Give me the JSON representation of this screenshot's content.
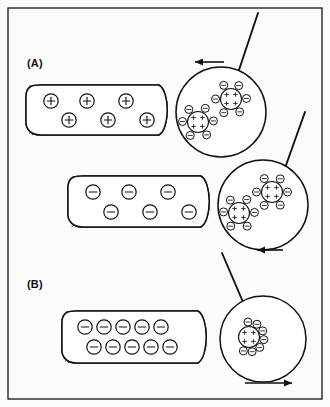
{
  "figure": {
    "background_color": "#fbfbfa",
    "ink_color": "#111111",
    "width": 330,
    "height": 407,
    "frame": {
      "x": 8,
      "y": 8,
      "width": 314,
      "height": 391
    }
  },
  "panels": [
    {
      "id": "panel-a",
      "label": "(A)",
      "label_x": 27,
      "label_y": 67
    },
    {
      "id": "panel-b",
      "label": "(B)",
      "label_x": 27,
      "label_y": 288
    }
  ],
  "capsules": [
    {
      "id": "capsule-a-positive",
      "panel": "(A)",
      "charge_sign": "+",
      "charge_symbol": "⊕",
      "x": 29,
      "y": 85,
      "width": 137,
      "height": 50,
      "corner_radius": 12,
      "hatch_band_width": 9,
      "carrier_radius": 7.2,
      "carrier_count": 6,
      "rows": [
        {
          "y_offset": 16,
          "x_offsets": [
            22,
            58,
            97
          ]
        },
        {
          "y_offset": 35,
          "x_offsets": [
            40,
            79,
            118
          ]
        }
      ]
    },
    {
      "id": "capsule-a-negative",
      "panel": "(A)",
      "charge_sign": "-",
      "charge_symbol": "⊖",
      "x": 71,
      "y": 176,
      "width": 137,
      "height": 51,
      "corner_radius": 12,
      "hatch_band_width": 9,
      "carrier_radius": 7.2,
      "carrier_count": 6,
      "rows": [
        {
          "y_offset": 16,
          "x_offsets": [
            22,
            58,
            97
          ]
        },
        {
          "y_offset": 36,
          "x_offsets": [
            40,
            79,
            118
          ]
        }
      ]
    },
    {
      "id": "capsule-b-negative",
      "panel": "(B)",
      "charge_sign": "-",
      "charge_symbol": "⊖",
      "x": 65,
      "y": 311,
      "width": 140,
      "height": 52,
      "corner_radius": 12,
      "hatch_band_width": 9,
      "carrier_radius": 7.2,
      "carrier_count": 10,
      "rows": [
        {
          "y_offset": 16,
          "x_offsets": [
            20,
            39,
            58,
            77,
            96
          ]
        },
        {
          "y_offset": 36,
          "x_offsets": [
            29,
            48,
            67,
            86,
            105
          ]
        }
      ]
    }
  ],
  "magnifiers": [
    {
      "id": "magnifier-a-positive",
      "panel": "(A)",
      "cx": 221,
      "cy": 112,
      "r": 45,
      "leader": {
        "x1": 238,
        "y1": 73,
        "x2": 258,
        "y2": 13
      },
      "arrow": {
        "direction": "left",
        "x_start": 224,
        "x_end": 195,
        "y": 62,
        "head_length": 8,
        "head_half_width": 3.6
      },
      "clusters": [
        {
          "id": "cluster-a-pos-upper",
          "cx": 231,
          "cy": 99,
          "core_r": 10.5,
          "core_charge": "+",
          "core_dot_count": 4,
          "satellite_r": 4.0,
          "satellite_charge": "-",
          "satellite_angles": [
            -118,
            -60,
            -2,
            56,
            118,
            180
          ],
          "satellite_orbit": 15.5
        },
        {
          "id": "cluster-a-pos-lower",
          "cx": 198,
          "cy": 122,
          "core_r": 10.5,
          "core_charge": "+",
          "core_dot_count": 4,
          "satellite_r": 4.0,
          "satellite_charge": "-",
          "satellite_angles": [
            -126,
            -62,
            -4,
            56,
            120,
            182
          ],
          "satellite_orbit": 15.5
        }
      ]
    },
    {
      "id": "magnifier-a-negative",
      "panel": "(A)",
      "cx": 263,
      "cy": 205,
      "r": 45,
      "leader": {
        "x1": 285,
        "y1": 168,
        "x2": 305,
        "y2": 112
      },
      "arrow": {
        "direction": "left",
        "x_start": 283,
        "x_end": 257,
        "y": 250,
        "head_length": 8,
        "head_half_width": 3.6
      },
      "clusters": [
        {
          "id": "cluster-a-neg-upper",
          "cx": 272,
          "cy": 192,
          "core_r": 10.5,
          "core_charge": "+",
          "core_dot_count": 4,
          "satellite_r": 4.0,
          "satellite_charge": "-",
          "satellite_angles": [
            -120,
            -58,
            0,
            58,
            120,
            180
          ],
          "satellite_orbit": 15.5
        },
        {
          "id": "cluster-a-neg-lower",
          "cx": 239,
          "cy": 213,
          "core_r": 10.5,
          "core_charge": "+",
          "core_dot_count": 4,
          "satellite_r": 4.0,
          "satellite_charge": "-",
          "satellite_angles": [
            -124,
            -60,
            -2,
            58,
            122,
            184
          ],
          "satellite_orbit": 15.5
        }
      ]
    },
    {
      "id": "magnifier-b-negative",
      "panel": "(B)",
      "cx": 263,
      "cy": 339,
      "r": 43,
      "leader": {
        "x1": 243,
        "y1": 302,
        "x2": 222,
        "y2": 253
      },
      "arrow": {
        "direction": "right",
        "x_start": 245,
        "x_end": 292,
        "y": 383,
        "head_length": 8,
        "head_half_width": 3.6
      },
      "clusters": [
        {
          "id": "cluster-b-neg",
          "cx": 249,
          "cy": 337,
          "core_r": 10.5,
          "core_charge": "+",
          "core_dot_count": 4,
          "satellite_r": 4.0,
          "satellite_charge": "-",
          "satellite_angles": [
            -94,
            -58,
            -24,
            10,
            44,
            78,
            112
          ],
          "satellite_orbit": 15.0
        }
      ]
    }
  ],
  "legend_meaning": {
    "core_symbol": "+",
    "satellite_symbol": "-",
    "capsule_positive_symbol": "⊕",
    "capsule_negative_symbol": "⊖"
  }
}
